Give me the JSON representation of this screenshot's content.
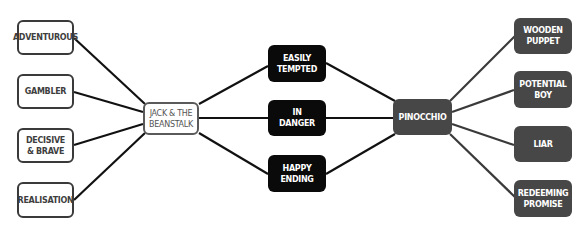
{
  "diagram": {
    "title": "",
    "colors": {
      "left_outline": "#3a3a3a",
      "shared_fill": "#0a0a0a",
      "right_fill": "#474747",
      "line": "#111111",
      "right_line": "#3a3a3a"
    },
    "left_hub": {
      "label": "JACK & THE\nBEANSTALK"
    },
    "left_traits": [
      {
        "label": "ADVENTUROUS"
      },
      {
        "label": "GAMBLER"
      },
      {
        "label": "DECISIVE\n& BRAVE"
      },
      {
        "label": "REALISATION"
      }
    ],
    "shared": [
      {
        "label": "EASILY\nTEMPTED"
      },
      {
        "label": "IN\nDANGER"
      },
      {
        "label": "HAPPY\nENDING"
      }
    ],
    "right_hub": {
      "label": "PINOCCHIO"
    },
    "right_traits": [
      {
        "label": "WOODEN\nPUPPET"
      },
      {
        "label": "POTENTIAL\nBOY"
      },
      {
        "label": "LIAR"
      },
      {
        "label": "REDEEMING\nPROMISE"
      }
    ]
  }
}
